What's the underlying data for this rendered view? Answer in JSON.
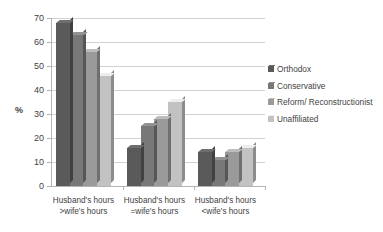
{
  "chart_data": {
    "type": "bar",
    "title": "",
    "subtitle": "",
    "xlabel": "",
    "ylabel": "%",
    "ylim": [
      0,
      70
    ],
    "ytick_values": [
      0,
      10,
      20,
      30,
      40,
      50,
      60,
      70
    ],
    "ytick_labels": [
      "0",
      "10",
      "20",
      "30",
      "40",
      "50",
      "60",
      "70"
    ],
    "grid": true,
    "legend_position": "right",
    "categories": [
      "Husband's hours >wife's hours",
      "Husband's hours =wife's hours",
      "Husband's hours <wife's hours"
    ],
    "category_lines": [
      [
        "Husband's hours",
        ">wife's hours"
      ],
      [
        "Husband's hours",
        "=wife's hours"
      ],
      [
        "Husband's hours",
        "<wife's hours"
      ]
    ],
    "series": [
      {
        "name": "Orthodox",
        "color": "#5a5a5a",
        "values": [
          68,
          16,
          14
        ]
      },
      {
        "name": "Conservative",
        "color": "#787878",
        "values": [
          63,
          25,
          11
        ]
      },
      {
        "name": "Reform/ Reconstructionist",
        "color": "#9a9a9a",
        "values": [
          56,
          28,
          14
        ]
      },
      {
        "name": "Unaffiliated",
        "color": "#c2c2c2",
        "values": [
          46,
          35,
          16
        ]
      }
    ]
  },
  "legend": {
    "items": [
      {
        "label": "Orthodox"
      },
      {
        "label": "Conservative"
      },
      {
        "label": "Reform/ Reconstructionist"
      },
      {
        "label": "Unaffiliated"
      }
    ]
  }
}
